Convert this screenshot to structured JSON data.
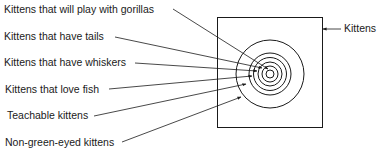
{
  "diagram": {
    "universe_label": "Kittens",
    "subset_labels": [
      "Kittens that will play with gorillas",
      "Kittens that have tails",
      "Kittens that have whiskers",
      "Kittens that love fish",
      "Teachable kittens",
      "Non-green-eyed kittens"
    ],
    "colors": {
      "line": "#1a1a1a",
      "background": "#ffffff"
    }
  }
}
